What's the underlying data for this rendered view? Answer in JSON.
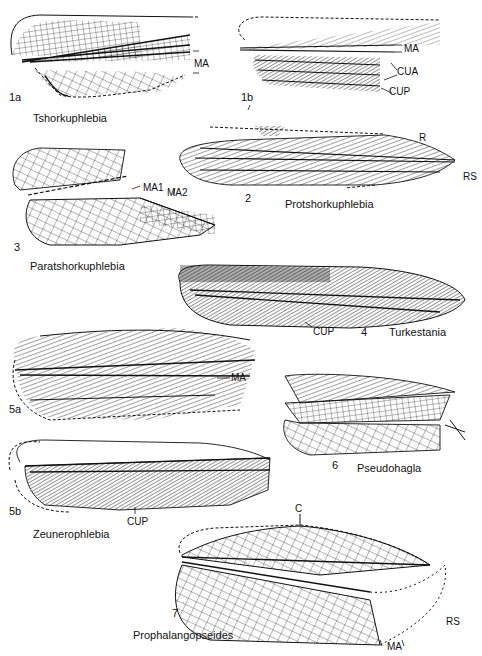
{
  "plate": {
    "figures": [
      {
        "id": "1a",
        "number": "1a",
        "taxon": "Tshorkuphlebia",
        "vein_labels": [
          "MA"
        ]
      },
      {
        "id": "1b",
        "number": "1b",
        "taxon": "Tshorkuphlebia",
        "vein_labels": [
          "MA",
          "CUA",
          "CUP"
        ]
      },
      {
        "id": "2",
        "number": "2",
        "taxon": "Protshorkuphlebia",
        "vein_labels": [
          "R",
          "RS"
        ]
      },
      {
        "id": "3",
        "number": "3",
        "taxon": "Paratshorkuphlebia",
        "vein_labels": [
          "MA1",
          "MA2"
        ]
      },
      {
        "id": "4",
        "number": "4",
        "taxon": "Turkestania",
        "vein_labels": [
          "CUP"
        ]
      },
      {
        "id": "5a",
        "number": "5a",
        "taxon": "Zeunerophlebia",
        "vein_labels": [
          "MA"
        ]
      },
      {
        "id": "5b",
        "number": "5b",
        "taxon": "Zeunerophlebia",
        "vein_labels": [
          "CUP"
        ]
      },
      {
        "id": "6",
        "number": "6",
        "taxon": "Pseudohagla",
        "vein_labels": []
      },
      {
        "id": "7",
        "number": "7",
        "taxon": "Prophalangopseides",
        "vein_labels": [
          "C",
          "RS",
          "MA"
        ]
      }
    ]
  },
  "labels": {
    "f1a_num": "1a",
    "f1a_ma": "MA",
    "f1_name": "Tshorkuphlebia",
    "f1b_num": "1b",
    "f1b_ma": "MA",
    "f1b_cua": "CUA",
    "f1b_cup": "CUP",
    "f2_num": "2",
    "f2_r": "R",
    "f2_rs": "RS",
    "f2_name": "Protshorkuphlebia",
    "f3_num": "3",
    "f3_ma1": "MA1",
    "f3_ma2": "MA2",
    "f3_name": "Paratshorkuphlebia",
    "f4_num": "4",
    "f4_cup": "CUP",
    "f4_name": "Turkestania",
    "f5a_num": "5a",
    "f5a_ma": "MA",
    "f5b_num": "5b",
    "f5b_cup": "CUP",
    "f5_name": "Zeunerophlebia",
    "f6_num": "6",
    "f6_name": "Pseudohagla",
    "f7_num": "7",
    "f7_c": "C",
    "f7_rs": "RS",
    "f7_ma": "MA",
    "f7_name": "Prophalangopseides"
  },
  "colors": {
    "ink": "#111111",
    "paper": "#ffffff"
  }
}
